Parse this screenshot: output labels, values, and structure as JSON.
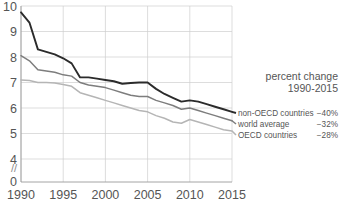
{
  "chart_data": {
    "type": "line",
    "title": "",
    "xlabel": "",
    "ylabel": "",
    "grid": true,
    "legend_position": "right",
    "xlim": [
      1990,
      2015
    ],
    "ylim": [
      4,
      10
    ],
    "y_axis_break": true,
    "y_break_symbol": "//",
    "y_zero_label": "0",
    "ytick_labels": [
      "10",
      "9",
      "8",
      "7",
      "6",
      "5",
      "4"
    ],
    "ytick_values": [
      10,
      9,
      8,
      7,
      6,
      5,
      4
    ],
    "xtick_labels": [
      "1990",
      "1995",
      "2000",
      "2005",
      "2010",
      "2015"
    ],
    "xtick_values": [
      1990,
      1995,
      2000,
      2005,
      2010,
      2015
    ],
    "x": [
      1990,
      1991,
      1992,
      1993,
      1994,
      1995,
      1996,
      1997,
      1998,
      1999,
      2000,
      2001,
      2002,
      2003,
      2004,
      2005,
      2006,
      2007,
      2008,
      2009,
      2010,
      2011,
      2012,
      2013,
      2014,
      2015
    ],
    "series": [
      {
        "name": "non-OECD countries",
        "color": "#2b2b2b",
        "width": 1.9,
        "percent_change": "−40%",
        "values": [
          9.75,
          9.35,
          8.3,
          8.2,
          8.1,
          7.95,
          7.75,
          7.2,
          7.2,
          7.15,
          7.1,
          7.05,
          6.95,
          6.98,
          7.0,
          7.0,
          6.75,
          6.55,
          6.4,
          6.25,
          6.3,
          6.25,
          6.15,
          6.05,
          5.95,
          5.85
        ]
      },
      {
        "name": "world average",
        "color": "#7d7d7d",
        "width": 1.5,
        "percent_change": "−32%",
        "values": [
          8.05,
          7.85,
          7.5,
          7.45,
          7.4,
          7.3,
          7.25,
          7.0,
          6.9,
          6.85,
          6.8,
          6.7,
          6.6,
          6.5,
          6.45,
          6.45,
          6.3,
          6.2,
          6.1,
          5.95,
          6.0,
          5.9,
          5.8,
          5.7,
          5.6,
          5.5
        ]
      },
      {
        "name": "OECD countries",
        "color": "#b5b5b5",
        "width": 1.5,
        "percent_change": "−28%",
        "values": [
          7.1,
          7.08,
          7.0,
          7.0,
          6.98,
          6.92,
          6.85,
          6.6,
          6.5,
          6.4,
          6.3,
          6.2,
          6.1,
          6.0,
          5.9,
          5.85,
          5.7,
          5.6,
          5.45,
          5.4,
          5.55,
          5.45,
          5.35,
          5.25,
          5.15,
          5.1
        ]
      }
    ]
  },
  "legend": {
    "title_line1": "percent change",
    "title_line2": "1990-2015",
    "rows": [
      {
        "label": "non-OECD countries",
        "value": "−40%"
      },
      {
        "label": "world average",
        "value": "−32%"
      },
      {
        "label": "OECD countries",
        "value": "−28%"
      }
    ]
  },
  "colors": {
    "grid": "#cfcfcf",
    "axis": "#9a9a9a",
    "text": "#555555",
    "series_dark": "#2b2b2b",
    "series_mid": "#7d7d7d",
    "series_light": "#b5b5b5",
    "background": "#ffffff"
  }
}
